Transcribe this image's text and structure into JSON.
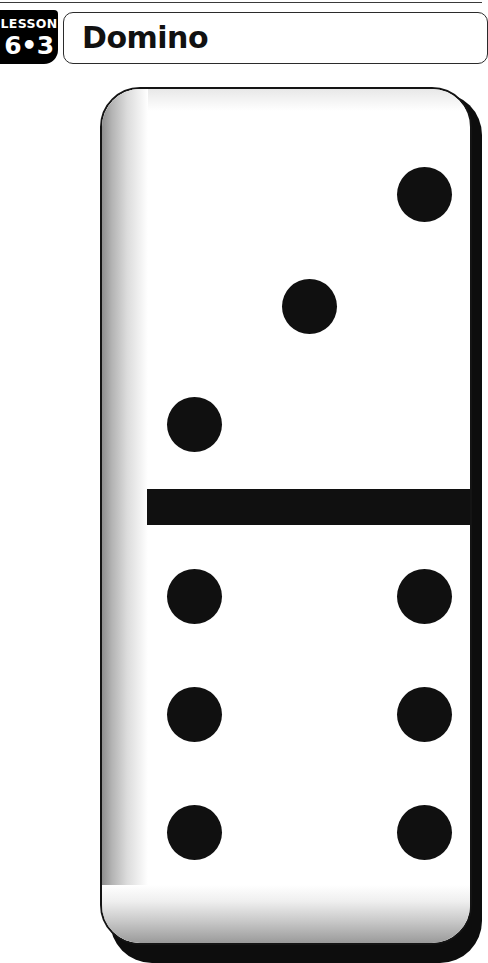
{
  "page": {
    "background_color": "#ffffff",
    "rule_color": "#3a3a3a"
  },
  "header": {
    "badge": {
      "label": "LESSON",
      "number": "6•3",
      "background_color": "#000000",
      "text_color": "#ffffff"
    },
    "title": "Domino",
    "title_color": "#111111",
    "box_border_color": "#2b2b2b"
  },
  "domino": {
    "name": "domino-tile",
    "face_color": "#ffffff",
    "pip_color": "#101010",
    "outline_color": "#141414",
    "shadow_color": "#0d0d0d",
    "divider_color": "#101010",
    "top_half": {
      "pip_count": "3",
      "arrangement": "diagonal",
      "pips": [
        {
          "name": "pip-top-right",
          "x": 295,
          "y": 78
        },
        {
          "name": "pip-center",
          "x": 180,
          "y": 190
        },
        {
          "name": "pip-bottom-left",
          "x": 65,
          "y": 308
        }
      ]
    },
    "bottom_half": {
      "pip_count": "6",
      "arrangement": "two-columns-of-three",
      "pips": [
        {
          "name": "pip-left-top",
          "x": 65,
          "y": 480
        },
        {
          "name": "pip-right-top",
          "x": 295,
          "y": 480
        },
        {
          "name": "pip-left-middle",
          "x": 65,
          "y": 598
        },
        {
          "name": "pip-right-middle",
          "x": 295,
          "y": 598
        },
        {
          "name": "pip-left-bottom",
          "x": 65,
          "y": 716
        },
        {
          "name": "pip-right-bottom",
          "x": 295,
          "y": 716
        }
      ]
    },
    "total_pips": "9"
  }
}
